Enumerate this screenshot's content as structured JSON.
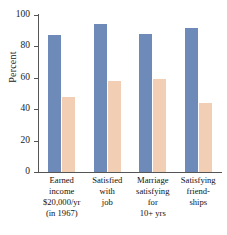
{
  "chart_data": {
    "type": "bar",
    "title": "",
    "subtitle": "",
    "xlabel": "",
    "ylabel": "Percent",
    "ylim": [
      0,
      100
    ],
    "yticks": [
      0,
      20,
      40,
      60,
      80,
      100
    ],
    "ytick_labels": [
      "0",
      "20",
      "40",
      "60",
      "80",
      "100"
    ],
    "grid": false,
    "legend_position": "none",
    "categories": [
      "Earned income $20,000/yr (in 1967)",
      "Satisfied with job",
      "Marriage satisfying for 10+ yrs",
      "Satisfying friendships"
    ],
    "category_label_lines": [
      [
        "Earned",
        "income",
        "$20,000/yr",
        "(in 1967)"
      ],
      [
        "Satisfied",
        "with",
        "job"
      ],
      [
        "Marriage",
        "satisfying",
        "for",
        "10+ yrs"
      ],
      [
        "Satisfying",
        "friend-",
        "ships"
      ]
    ],
    "series": [
      {
        "name": "blue-series",
        "color": "#6e8ab9",
        "values": [
          87,
          94,
          88,
          92
        ]
      },
      {
        "name": "peach-series",
        "color": "#f2cfb4",
        "values": [
          48,
          58,
          59,
          44
        ]
      }
    ]
  },
  "colors": {
    "series_blue": "#6e8ab9",
    "series_peach": "#f2cfb4",
    "axis": "#555555",
    "text": "#1a1a1a",
    "background": "#ffffff"
  }
}
